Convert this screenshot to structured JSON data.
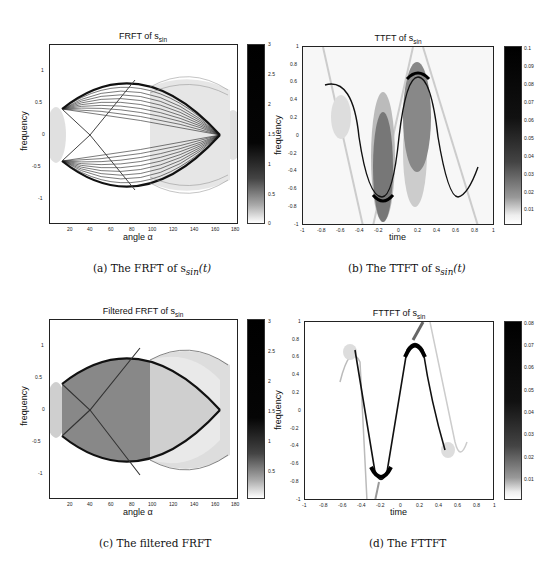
{
  "figures": [
    {
      "id": "a",
      "title": "FRFT of s",
      "title_sub": "sin",
      "xlabel": "angle α",
      "ylabel": "frequency",
      "xticks": [
        "20",
        "40",
        "60",
        "80",
        "100",
        "120",
        "140",
        "160",
        "180"
      ],
      "yticks": [
        "1",
        "0.5",
        "0",
        "-0.5",
        "-1"
      ],
      "colorbar_ticks": [
        "3",
        "2.5",
        "2",
        "1.5",
        "1",
        "0.5",
        "0"
      ],
      "caption": "(a) The FRFT of s",
      "caption_sub": "sin",
      "caption_suffix": "(t)"
    },
    {
      "id": "b",
      "title": "TTFT of s",
      "title_sub": "sin",
      "xlabel": "time",
      "ylabel": "frequency",
      "xticks": [
        "-1",
        "-0.8",
        "-0.6",
        "-0.4",
        "-0.2",
        "0",
        "0.2",
        "0.4",
        "0.6",
        "0.8",
        "1"
      ],
      "yticks": [
        "1",
        "0.8",
        "0.6",
        "0.4",
        "0.2",
        "0",
        "-0.2",
        "-0.4",
        "-0.6",
        "-0.8",
        "-1"
      ],
      "colorbar_ticks": [
        "0.1",
        "0.09",
        "0.08",
        "0.07",
        "0.06",
        "0.05",
        "0.04",
        "0.03",
        "0.02",
        "0.01"
      ],
      "caption": "(b) The TTFT of s",
      "caption_sub": "sin",
      "caption_suffix": "(t)"
    },
    {
      "id": "c",
      "title": "Filtered FRFT of s",
      "title_sub": "sin",
      "xlabel": "angle α",
      "ylabel": "frequency",
      "xticks": [
        "20",
        "40",
        "60",
        "80",
        "100",
        "120",
        "140",
        "160",
        "180"
      ],
      "yticks": [
        "1",
        "0.5",
        "0",
        "-0.5",
        "-1"
      ],
      "colorbar_ticks": [
        "3",
        "2.5",
        "2",
        "1.5",
        "1",
        "0.5"
      ],
      "caption": "(c) The filtered FRFT",
      "caption_sub": "",
      "caption_suffix": ""
    },
    {
      "id": "d",
      "title": "FTTFT of s",
      "title_sub": "sin",
      "xlabel": "time",
      "ylabel": "frequency",
      "xticks": [
        "-1",
        "-0.8",
        "-0.6",
        "-0.4",
        "-0.2",
        "0",
        "0.2",
        "0.4",
        "0.6",
        "0.8",
        "1"
      ],
      "yticks": [
        "1",
        "0.8",
        "0.6",
        "0.4",
        "0.2",
        "0",
        "-0.2",
        "-0.4",
        "-0.6",
        "-0.8",
        "-1"
      ],
      "colorbar_ticks": [
        "0.08",
        "0.07",
        "0.06",
        "0.05",
        "0.04",
        "0.03",
        "0.02",
        "0.01"
      ],
      "caption": "(d) The FTTFT",
      "caption_sub": "",
      "caption_suffix": ""
    }
  ],
  "colors": {
    "ink": "#111111",
    "background": "#ffffff",
    "colormap": "gray-reversed"
  }
}
